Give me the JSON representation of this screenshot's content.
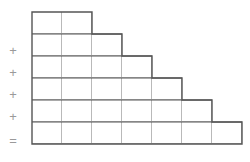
{
  "figure": {
    "operators": [
      {
        "symbol": "+",
        "y": 44
      },
      {
        "symbol": "+",
        "y": 66
      },
      {
        "symbol": "+",
        "y": 88
      },
      {
        "symbol": "+",
        "y": 110
      },
      {
        "symbol": "=",
        "y": 134
      }
    ],
    "colors": {
      "outline": "#555555",
      "gridline": "#b9b9b9",
      "operator": "#9a9a9a",
      "background": "#ffffff"
    },
    "geometry": {
      "cell_width": 30,
      "cell_height": 22,
      "origin_x": 32,
      "origin_y": 12
    }
  },
  "chart_data": {
    "type": "bar",
    "title": "",
    "xlabel": "",
    "ylabel": "",
    "categories": [
      "row 1",
      "row 2",
      "row 3",
      "row 4",
      "row 5",
      "row 6"
    ],
    "values": [
      2,
      3,
      4,
      5,
      6,
      7
    ],
    "series": [
      {
        "name": "cells per row",
        "values": [
          2,
          3,
          4,
          5,
          6,
          7
        ]
      }
    ],
    "annotations": [
      "+",
      "+",
      "+",
      "+",
      "="
    ],
    "grid": true,
    "legend": "none",
    "ylim": [
      0,
      7
    ]
  }
}
